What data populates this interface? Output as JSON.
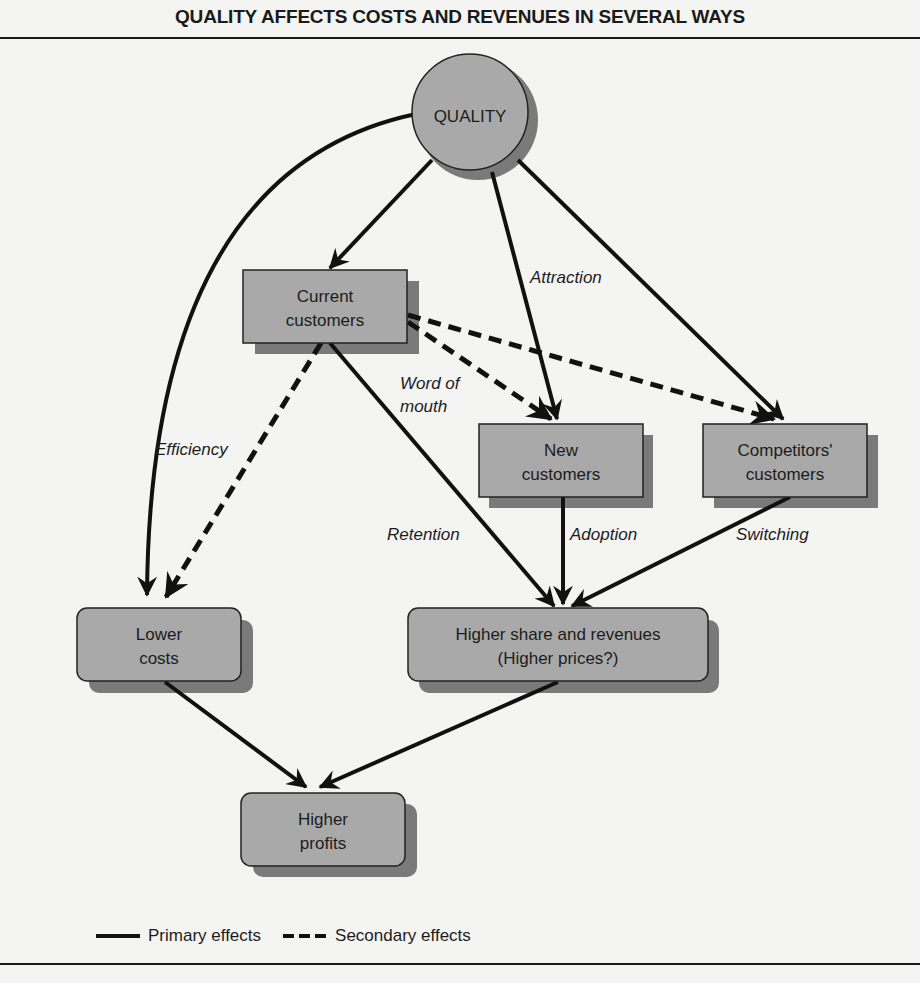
{
  "title": "QUALITY AFFECTS COSTS AND REVENUES IN SEVERAL WAYS",
  "nodes": {
    "quality": "QUALITY",
    "current": [
      "Current",
      "customers"
    ],
    "new": [
      "New",
      "customers"
    ],
    "competitors": [
      "Competitors'",
      "customers"
    ],
    "lower_costs": [
      "Lower",
      "costs"
    ],
    "higher_share": [
      "Higher share and revenues",
      "(Higher prices?)"
    ],
    "higher_profits": [
      "Higher",
      "profits"
    ]
  },
  "edge_labels": {
    "attraction": "Attraction",
    "word_of_mouth": [
      "Word of",
      "mouth"
    ],
    "efficiency": "Efficiency",
    "retention": "Retention",
    "adoption": "Adoption",
    "switching": "Switching"
  },
  "legend": {
    "primary": "Primary effects",
    "secondary": "Secondary effects"
  },
  "colors": {
    "node_fill": "#a9a9a9",
    "node_shadow": "#7a7a7a",
    "line": "#111111",
    "background": "#f4f4f2"
  }
}
